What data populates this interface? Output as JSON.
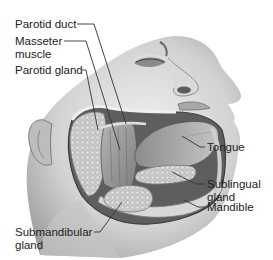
{
  "figure": {
    "labels": [
      {
        "id": "parotid-duct",
        "text": "Parotid duct"
      },
      {
        "id": "masseter-muscle",
        "line1": "Masseter",
        "line2": "muscle"
      },
      {
        "id": "parotid-gland",
        "text": "Parotid gland"
      },
      {
        "id": "tongue",
        "text": "Tongue"
      },
      {
        "id": "sublingual-gland",
        "line1": "Sublingual",
        "line2": "gland"
      },
      {
        "id": "mandible",
        "text": "Mandible"
      },
      {
        "id": "submandibular-gland",
        "line1": "Submandibular",
        "line2": "gland"
      }
    ]
  },
  "colors": {
    "background": "#ffffff",
    "text": "#222222",
    "leader_line": "#333333",
    "skin_light": "#e6e6e6",
    "skin_mid": "#bdbdbd",
    "skin_dark": "#7a7a7a",
    "gland": "#cfcfcf",
    "muscle": "#9a9a9a"
  }
}
